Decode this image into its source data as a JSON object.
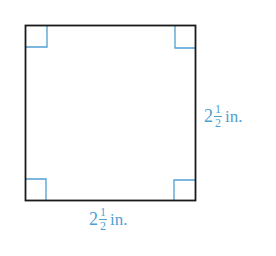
{
  "figure": {
    "shape": "square",
    "colors": {
      "outline": "#1a1a1a",
      "right_angle_marks": "#4f9fd3",
      "labels": "#4f9fd3"
    },
    "right_angle_marks": [
      "top-left",
      "top-right",
      "bottom-left",
      "bottom-right"
    ],
    "side_label_right": {
      "whole": "2",
      "numerator": "1",
      "denominator": "2",
      "unit": "in."
    },
    "side_label_bottom": {
      "whole": "2",
      "numerator": "1",
      "denominator": "2",
      "unit": "in."
    }
  }
}
